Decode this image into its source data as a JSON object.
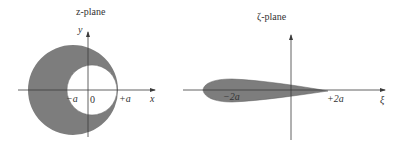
{
  "colors": {
    "shade": "#7d7d7d",
    "axis": "#3a3a3a",
    "background": "#ffffff"
  },
  "z_plane": {
    "title": "z-plane",
    "y_axis_label": "y",
    "x_axis_label": "x",
    "tick_neg_a": "−a",
    "tick_origin": "0",
    "tick_pos_a": "+a"
  },
  "zeta_plane": {
    "title": "ζ-plane",
    "x_axis_label": "ξ",
    "tick_neg_2a": "−2a",
    "tick_pos_2a": "+2a"
  }
}
